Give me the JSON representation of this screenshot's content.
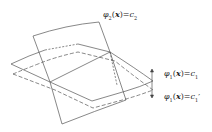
{
  "labels": {
    "phi2": {
      "func": "φ",
      "sub": "2",
      "arg": "x",
      "eq": "=",
      "rhs": "c",
      "rhs_sub": "2"
    },
    "phi1": {
      "func": "φ",
      "sub": "1",
      "arg": "x",
      "eq": "=",
      "rhs": "c",
      "rhs_sub": "1"
    },
    "phi1p": {
      "func": "φ",
      "sub": "1",
      "arg": "x",
      "eq": "=",
      "rhs": "c",
      "rhs_sub": "1",
      "prime": "′"
    }
  },
  "colors": {
    "stroke": "#555555",
    "text": "#222222"
  }
}
